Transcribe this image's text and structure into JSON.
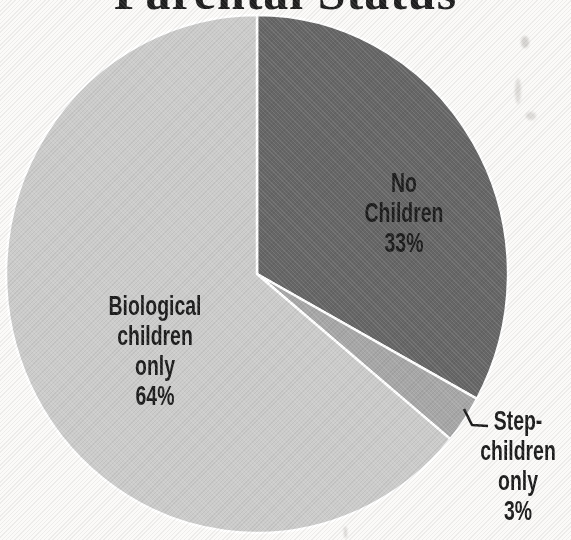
{
  "title": "Parental Status",
  "chart_data": {
    "type": "pie",
    "title": "Parental Status",
    "start_angle_deg": 0,
    "direction": "clockwise",
    "legend": "none",
    "separator_color": "#ffffff",
    "leader_line_color": "#1a1a1a",
    "label_text_color": "#1b1b1b",
    "background_color": "#fbfaf8",
    "slices": [
      {
        "label": "No Children",
        "value": 33,
        "percent_text": "33%",
        "color": "#666666",
        "label_position": "inside",
        "label_lines": [
          "No",
          "Children",
          "33%"
        ]
      },
      {
        "label": "Step-children only",
        "value": 3,
        "percent_text": "3%",
        "color": "#a7a7a7",
        "label_position": "outside-right",
        "label_lines": [
          "Step-",
          "children",
          "only",
          "3%"
        ]
      },
      {
        "label": "Biological children only",
        "value": 64,
        "percent_text": "64%",
        "color": "#cccccb",
        "label_position": "inside",
        "label_lines": [
          "Biological",
          "children",
          "only",
          "64%"
        ]
      }
    ]
  }
}
